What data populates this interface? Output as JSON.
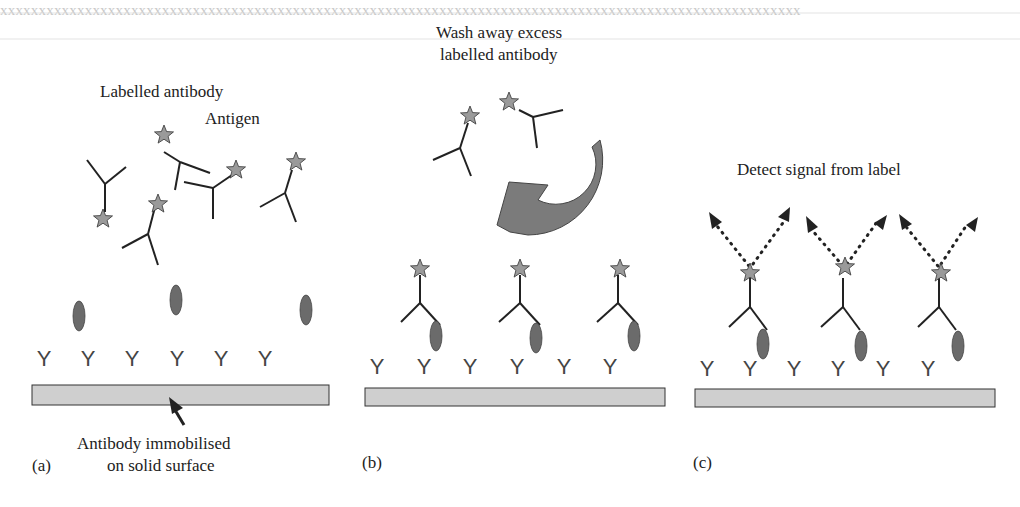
{
  "figure": {
    "panels": [
      {
        "id": "a",
        "panel_label": "(a)",
        "labels": {
          "labelled_antibody": "Labelled antibody",
          "antigen": "Antigen",
          "immobilised": "Antibody immobilised",
          "immobilised_line2": "on solid surface"
        }
      },
      {
        "id": "b",
        "panel_label": "(b)",
        "labels": {
          "wash_line1": "Wash away excess",
          "wash_line2": "labelled antibody"
        }
      },
      {
        "id": "c",
        "panel_label": "(c)",
        "labels": {
          "detect": "Detect signal from label"
        }
      }
    ],
    "colors": {
      "star_fill": "#9a9a9a",
      "antigen_fill": "#6b6b6b",
      "surface_fill": "#cfcfcf",
      "arrow_fill": "#777777",
      "line": "#222222"
    },
    "icons": [
      "star-label-icon",
      "antigen-ellipse-icon",
      "antibody-y-icon",
      "curved-wash-arrow-icon",
      "signal-arrow-icon",
      "pointer-arrow-icon"
    ]
  }
}
